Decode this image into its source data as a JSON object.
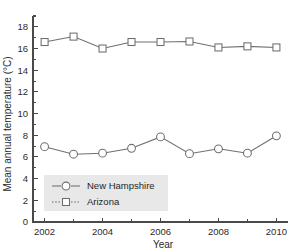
{
  "chart_data": {
    "type": "line",
    "title": "",
    "xlabel": "Year",
    "ylabel": "Mean annual temperature (°C)",
    "x": [
      2002,
      2003,
      2004,
      2005,
      2006,
      2007,
      2008,
      2009,
      2010
    ],
    "xlim": [
      2001.6,
      2010.4
    ],
    "ylim": [
      0,
      19
    ],
    "grid": false,
    "legend_position": "lower-left",
    "x_tick_labels": [
      "2002",
      "2004",
      "2006",
      "2008",
      "2010"
    ],
    "x_tick_values": [
      2002,
      2004,
      2006,
      2008,
      2010
    ],
    "x_minor_ticks": [
      2003,
      2005,
      2007,
      2009
    ],
    "y_tick_labels": [
      "0",
      "2",
      "4",
      "6",
      "8",
      "10",
      "12",
      "14",
      "16",
      "18"
    ],
    "y_tick_values": [
      0,
      2,
      4,
      6,
      8,
      10,
      12,
      14,
      16,
      18
    ],
    "series": [
      {
        "name": "New Hampshire",
        "marker": "circle",
        "values": [
          6.95,
          6.25,
          6.35,
          6.8,
          7.85,
          6.3,
          6.75,
          6.35,
          7.95
        ]
      },
      {
        "name": "Arizona",
        "marker": "square",
        "values": [
          16.6,
          17.1,
          16.0,
          16.6,
          16.6,
          16.65,
          16.1,
          16.2,
          16.1
        ]
      }
    ]
  },
  "legend": {
    "entries": [
      {
        "label": "New Hampshire",
        "marker": "circle"
      },
      {
        "label": "Arizona",
        "marker": "square"
      }
    ]
  },
  "colors": {
    "line": "#6e6e6e",
    "axis": "#4a4a4a",
    "text": "#2b2b2b",
    "legend_background": "#e8e8e8",
    "plot_background": "#ffffff"
  }
}
